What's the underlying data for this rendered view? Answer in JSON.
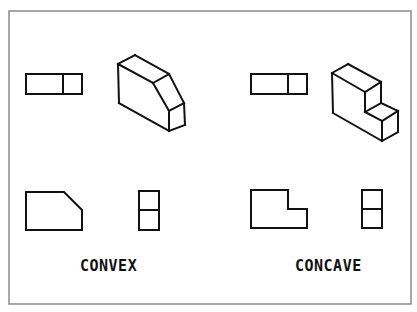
{
  "diagram": {
    "frame": {
      "x": 9,
      "y": 11,
      "width": 402,
      "height": 293,
      "stroke": "#8a8a8a"
    },
    "stroke_color": "#111111",
    "panels": [
      {
        "id": "convex",
        "label": "CONVEX",
        "label_pos": {
          "x": 80,
          "y": 271
        },
        "top_view": {
          "rect": [
            26,
            74,
            56,
            20
          ],
          "divider_x": 63
        },
        "isometric_view": {
          "segments": [
            [
              [
                118,
                64
              ],
              [
                135,
                55
              ]
            ],
            [
              [
                135,
                55
              ],
              [
                169,
                74
              ]
            ],
            [
              [
                118,
                64
              ],
              [
                153,
                83
              ]
            ],
            [
              [
                153,
                83
              ],
              [
                169,
                74
              ]
            ],
            [
              [
                118,
                64
              ],
              [
                119,
                103
              ]
            ],
            [
              [
                119,
                103
              ],
              [
                169,
                131
              ]
            ],
            [
              [
                153,
                83
              ],
              [
                169,
                111
              ]
            ],
            [
              [
                169,
                74
              ],
              [
                184,
                103
              ]
            ],
            [
              [
                169,
                111
              ],
              [
                184,
                103
              ]
            ],
            [
              [
                169,
                111
              ],
              [
                169,
                131
              ]
            ],
            [
              [
                184,
                103
              ],
              [
                185,
                125
              ]
            ],
            [
              [
                169,
                131
              ],
              [
                185,
                125
              ]
            ]
          ]
        },
        "front_view": {
          "points": [
            [
              26,
              192
            ],
            [
              64,
              192
            ],
            [
              82,
              210
            ],
            [
              82,
              230
            ],
            [
              26,
              230
            ]
          ]
        },
        "side_view": {
          "rect": [
            139,
            191,
            20,
            39
          ],
          "divider_y": 210
        }
      },
      {
        "id": "concave",
        "label": "CONCAVE",
        "label_pos": {
          "x": 295,
          "y": 271
        },
        "top_view": {
          "rect": [
            251,
            74,
            56,
            20
          ],
          "divider_x": 288
        },
        "isometric_view": {
          "segments": [
            [
              [
                332,
                73
              ],
              [
                348,
                64
              ]
            ],
            [
              [
                348,
                64
              ],
              [
                381,
                82
              ]
            ],
            [
              [
                332,
                73
              ],
              [
                365,
                92
              ]
            ],
            [
              [
                365,
                92
              ],
              [
                381,
                82
              ]
            ],
            [
              [
                332,
                73
              ],
              [
                333,
                113
              ]
            ],
            [
              [
                333,
                113
              ],
              [
                382,
                141
              ]
            ],
            [
              [
                365,
                92
              ],
              [
                365,
                112
              ]
            ],
            [
              [
                381,
                82
              ],
              [
                381,
                103
              ]
            ],
            [
              [
                365,
                112
              ],
              [
                381,
                103
              ]
            ],
            [
              [
                381,
                103
              ],
              [
                398,
                111
              ]
            ],
            [
              [
                365,
                112
              ],
              [
                382,
                121
              ]
            ],
            [
              [
                382,
                121
              ],
              [
                398,
                111
              ]
            ],
            [
              [
                382,
                121
              ],
              [
                382,
                141
              ]
            ],
            [
              [
                398,
                111
              ],
              [
                398,
                132
              ]
            ],
            [
              [
                382,
                141
              ],
              [
                398,
                132
              ]
            ]
          ]
        },
        "front_view": {
          "points": [
            [
              251,
              190
            ],
            [
              288,
              190
            ],
            [
              288,
              209
            ],
            [
              307,
              209
            ],
            [
              307,
              228
            ],
            [
              251,
              228
            ]
          ]
        },
        "side_view": {
          "rect": [
            362,
            190,
            20,
            38
          ],
          "divider_y": 209
        }
      }
    ]
  }
}
